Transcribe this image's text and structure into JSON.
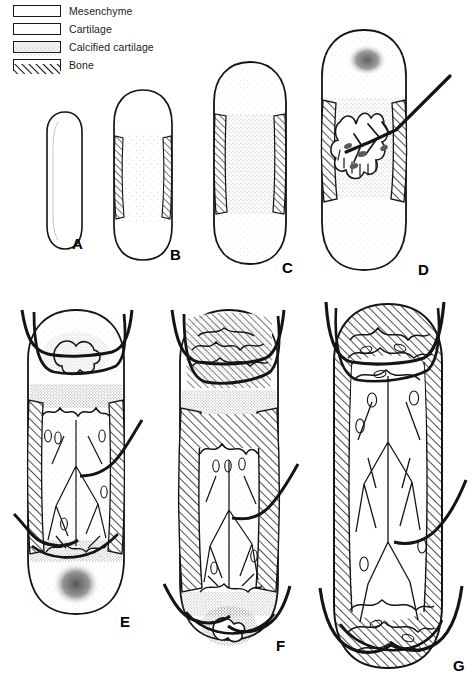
{
  "figure": {
    "background_color": "#ffffff",
    "ink_color": "#111111",
    "caption": ""
  },
  "legend": {
    "items": [
      {
        "label": "Mesenchyme",
        "pattern": "outline-white",
        "swatch_class": "mesenchyme",
        "fill": "#ffffff"
      },
      {
        "label": "Cartilage",
        "pattern": "outline-white",
        "swatch_class": "cartilage",
        "fill": "#ffffff"
      },
      {
        "label": "Calcified cartilage",
        "pattern": "stipple-gray",
        "swatch_class": "calcified",
        "fill": "#f0f0f0"
      },
      {
        "label": "Bone",
        "pattern": "diagonal-hatch",
        "swatch_class": "bone",
        "fill": "#ffffff"
      }
    ]
  },
  "panels": [
    {
      "id": "A",
      "label": "A",
      "description": "Mesenchymal condensation / hyaline cartilage model",
      "features": [
        "cartilage-model-outline"
      ],
      "x": 40,
      "y": 112,
      "w": 46,
      "h": 135,
      "label_x": 72,
      "label_y": 236
    },
    {
      "id": "B",
      "label": "B",
      "description": "Bone collar forms around diaphysis; central chondrocyte hypertrophy",
      "features": [
        "cartilage-model-outline",
        "bone-collar",
        "central-stipple"
      ],
      "x": 104,
      "y": 90,
      "w": 72,
      "h": 168,
      "label_x": 170,
      "label_y": 247
    },
    {
      "id": "C",
      "label": "C",
      "description": "Cartilage calcifies in the centre of the diaphysis; bone collar thickens",
      "features": [
        "cartilage-model-outline",
        "bone-collar",
        "calcified-cartilage-zone"
      ],
      "x": 208,
      "y": 62,
      "w": 78,
      "h": 200,
      "label_x": 282,
      "label_y": 260
    },
    {
      "id": "D",
      "label": "D",
      "description": "Periosteal bud with blood vessel invades; primary ossification centre forms; secondary centre appears in epiphysis",
      "features": [
        "bone-collar",
        "calcified-cartilage-zone",
        "primary-ossification-centre",
        "invading-blood-vessel",
        "secondary-centre-forming"
      ],
      "x": 316,
      "y": 30,
      "w": 94,
      "h": 236,
      "label_x": 418,
      "label_y": 262
    },
    {
      "id": "E",
      "label": "E",
      "description": "Medullary cavity enlarges; epiphyseal secondary ossification centres develop; vascular network expands",
      "features": [
        "bone-collar",
        "calcified-cartilage-zone",
        "medullary-cavity",
        "trabeculae",
        "secondary-centre-upper",
        "secondary-centre-lower",
        "blood-vessels"
      ],
      "x": 16,
      "y": 300,
      "w": 112,
      "h": 320,
      "label_x": 119,
      "label_y": 616
    },
    {
      "id": "F",
      "label": "F",
      "description": "Cortical bone thickens; epiphyseal ossification centres enlarge; growth plates remain",
      "features": [
        "thick-cortex",
        "epiphyseal-plate",
        "medullary-cavity",
        "trabeculae",
        "secondary-centre-upper",
        "secondary-centre-lower",
        "blood-vessels"
      ],
      "x": 166,
      "y": 300,
      "w": 118,
      "h": 344,
      "label_x": 277,
      "label_y": 640
    },
    {
      "id": "G",
      "label": "G",
      "description": "Mature long bone; epiphyses ossified, trabecular bone and marrow cavity throughout",
      "features": [
        "thick-cortex",
        "trabecular-bone",
        "marrow-cavity",
        "blood-vessels"
      ],
      "x": 318,
      "y": 296,
      "w": 130,
      "h": 376,
      "label_x": 451,
      "label_y": 665
    }
  ]
}
